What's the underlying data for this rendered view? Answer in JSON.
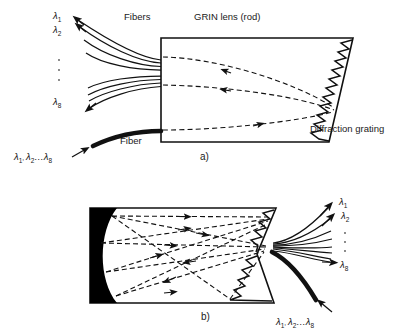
{
  "figure": {
    "type": "optical-diagram",
    "stroke_color": "#111111",
    "fill_black": "#000000",
    "background": "#ffffff"
  },
  "panel_a": {
    "caption": "a)",
    "labels": {
      "fibers": "Fibers",
      "grin_lens": "GRIN lens (rod)",
      "grating": "Diffraction grating",
      "fiber": "Fiber"
    },
    "output_wavelengths": [
      {
        "label": "λ",
        "sub": "1"
      },
      {
        "label": "λ",
        "sub": "2"
      },
      {
        "label": "λ",
        "sub": "8"
      }
    ],
    "ellipsis_dots": 3,
    "input_label": {
      "l1": "λ",
      "s1": "1",
      "l2": "λ",
      "s2": "2",
      "dots": "…",
      "l3": "λ",
      "s3": "8",
      "text": "λ1, λ2… λ8"
    },
    "fiber_count": 8,
    "ray_count": 3
  },
  "panel_b": {
    "caption": "b)",
    "output_wavelengths": [
      {
        "label": "λ",
        "sub": "1"
      },
      {
        "label": "λ",
        "sub": "2"
      },
      {
        "label": "λ",
        "sub": "8"
      }
    ],
    "ellipsis_dots": 3,
    "input_label": {
      "l1": "λ",
      "s1": "1",
      "l2": "λ",
      "s2": "2",
      "dots": "…",
      "l3": "λ",
      "s3": "8",
      "text": "λ1, λ2…λ8"
    },
    "fiber_count": 8,
    "ray_count": 4
  }
}
